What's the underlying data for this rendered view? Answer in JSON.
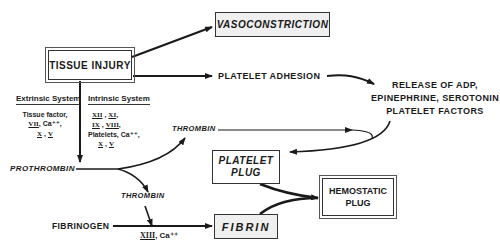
{
  "nodes": {
    "tissue_injury": "TISSUE INJURY",
    "vasoconstriction": "VASOCONSTRICTION",
    "platelet_adhesion": "PLATELET ADHESION",
    "release": [
      "RELEASE OF ADP,",
      "EPINEPHRINE, SEROTONIN",
      "PLATELET FACTORS"
    ],
    "prothrombin": "PROTHROMBIN",
    "thrombin_upper": "THROMBIN",
    "thrombin_lower": "THROMBIN",
    "platelet_plug": [
      "PLATELET",
      "PLUG"
    ],
    "hemostatic_plug": [
      "HEMOSTATIC",
      "PLUG"
    ],
    "fibrinogen": "FIBRINOGEN",
    "fibrin": "FIBRIN"
  },
  "extrinsic": {
    "title": "Extrinsic System",
    "line1": "Tissue factor,",
    "line2_factor": "VII",
    "line2_rest": ", Ca⁺⁺,",
    "line3_a": "X",
    "line3_sep": " , ",
    "line3_b": "V"
  },
  "intrinsic": {
    "title": "Intrinsic System",
    "l1_a": "XII",
    "l1_sep": " , ",
    "l1_b": "XI",
    "l1_end": ",",
    "l2_a": "IX",
    "l2_sep": " , ",
    "l2_b": "VIII",
    "l2_end": ",",
    "l3": "Platelets, Ca⁺⁺,",
    "l4_a": "X",
    "l4_sep": " , ",
    "l4_b": "V"
  },
  "fibrin_cofactors": {
    "factor": "XIII",
    "rest": ", Ca⁺⁺"
  }
}
